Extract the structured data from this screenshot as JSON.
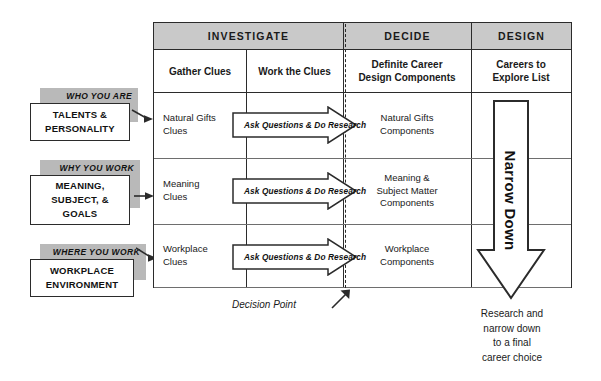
{
  "table": {
    "phases": [
      {
        "label": "INVESTIGATE"
      },
      {
        "label": "DECIDE"
      },
      {
        "label": "DESIGN"
      }
    ],
    "column_headers": [
      "Gather Clues",
      "Work the Clues",
      "Definite Career Design Components",
      "Careers to Explore List"
    ],
    "column_headers_lines": {
      "c1": "Gather Clues",
      "c2": "Work the Clues",
      "c3_line1": "Definite Career",
      "c3_line2": "Design Components",
      "c4_line1": "Careers to",
      "c4_line2": "Explore List"
    },
    "rows": [
      {
        "gather_clues_line1": "Natural Gifts",
        "gather_clues_line2": "Clues",
        "work_the_clues": "Ask Questions & Do Research",
        "components_line1": "Natural Gifts",
        "components_line2": "Components",
        "components_line3": ""
      },
      {
        "gather_clues_line1": "Meaning",
        "gather_clues_line2": "Clues",
        "work_the_clues": "Ask Questions & Do Research",
        "components_line1": "Meaning &",
        "components_line2": "Subject Matter",
        "components_line3": "Components"
      },
      {
        "gather_clues_line1": "Workplace",
        "gather_clues_line2": "Clues",
        "work_the_clues": "Ask Questions & Do Research",
        "components_line1": "Workplace",
        "components_line2": "Components",
        "components_line3": ""
      }
    ]
  },
  "inputs": [
    {
      "tab_label": "WHO YOU ARE",
      "box_line1": "TALENTS &",
      "box_line2": "PERSONALITY",
      "box_line3": ""
    },
    {
      "tab_label": "WHY YOU WORK",
      "box_line1": "MEANING,",
      "box_line2": "SUBJECT, &",
      "box_line3": "GOALS"
    },
    {
      "tab_label": "WHERE YOU WORK",
      "box_line1": "WORKPLACE",
      "box_line2": "ENVIRONMENT",
      "box_line3": ""
    }
  ],
  "narrow_down": {
    "label": "Narrow Down"
  },
  "annotations": {
    "decision_point": "Decision Point",
    "bottom_note_line1": "Research and",
    "bottom_note_line2": "narrow down",
    "bottom_note_line3": "to a final",
    "bottom_note_line4": "career choice"
  },
  "colors": {
    "header_gray": "#c9c9c9",
    "tab_gray": "#b9b9b9",
    "ink": "#2b2b2b",
    "rule_gray": "#6e6e6e"
  }
}
